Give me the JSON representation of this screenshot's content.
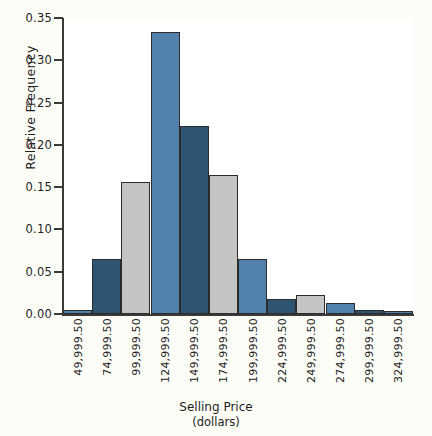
{
  "chart_data": {
    "type": "bar",
    "title": "",
    "xlabel": "Selling Price",
    "xlabel_sub": "(dollars)",
    "ylabel": "Relative Frequency",
    "categories": [
      "49,999.50",
      "74,999.50",
      "99,999.50",
      "124,999.50",
      "149,999.50",
      "174,999.50",
      "199,999.50",
      "224,999.50",
      "249,999.50",
      "274,999.50",
      "299,999.50",
      "324,999.50"
    ],
    "values": [
      0.005,
      0.065,
      0.156,
      0.333,
      0.222,
      0.164,
      0.065,
      0.018,
      0.022,
      0.013,
      0.005,
      0.004
    ],
    "bar_colors": [
      "#5282ab",
      "#2d5571",
      "#c4c4c2",
      "#5282ab",
      "#2d5571",
      "#c4c4c2",
      "#5282ab",
      "#2d5571",
      "#c4c4c2",
      "#5282ab",
      "#2d5571",
      "#5282ab"
    ],
    "ylim": [
      0.0,
      0.35
    ],
    "ytick_labels": [
      "0.00",
      "0.05",
      "0.10",
      "0.15",
      "0.20",
      "0.25",
      "0.30",
      "0.35"
    ],
    "ytick_values": [
      0.0,
      0.05,
      0.1,
      0.15,
      0.2,
      0.25,
      0.3,
      0.35
    ],
    "grid": false,
    "legend": "none",
    "colors": {
      "light_blue": "#5282ab",
      "dark_blue": "#2d5571",
      "gray": "#c4c4c2",
      "axis": "#3a3a3a",
      "bar_outline": "#2c2c2c",
      "background": "#fdfdf8",
      "plot_background": "#ffffff"
    }
  }
}
